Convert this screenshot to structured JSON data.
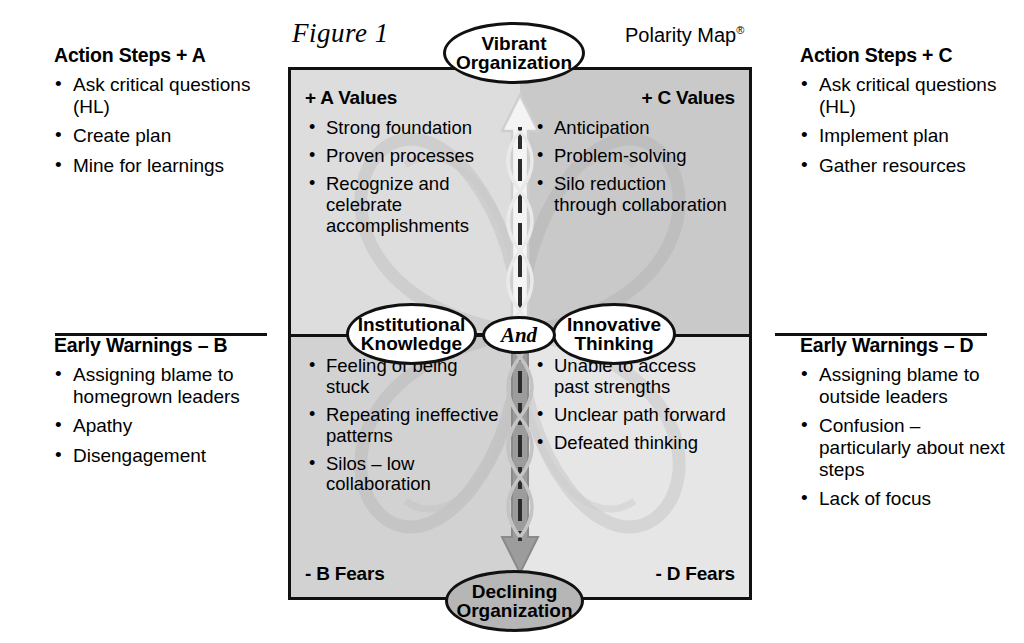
{
  "header": {
    "figure_label": "Figure 1",
    "polarity_map_label": "Polarity Map",
    "registered_mark": "®"
  },
  "ovals": {
    "top": "Vibrant\nOrganization",
    "top_line1": "Vibrant",
    "top_line2": "Organization",
    "bottom_line1": "Declining",
    "bottom_line2": "Organization",
    "left_line1": "Institutional",
    "left_line2": "Knowledge",
    "right_line1": "Innovative",
    "right_line2": "Thinking",
    "center": "And"
  },
  "quadrants": {
    "upper_left": {
      "heading": "+ A Values",
      "items": [
        "Strong foundation",
        "Proven processes",
        "Recognize and celebrate accomplishments"
      ]
    },
    "upper_right": {
      "heading": "+ C Values",
      "items": [
        "Anticipation",
        "Problem-solving",
        "Silo reduction through collaboration"
      ]
    },
    "lower_left": {
      "heading": "- B Fears",
      "items": [
        "Feeling of being stuck",
        "Repeating ineffective patterns",
        "Silos – low collaboration"
      ]
    },
    "lower_right": {
      "heading": "- D Fears",
      "items": [
        "Unable to access past strengths",
        "Unclear path forward",
        "Defeated thinking"
      ]
    }
  },
  "side_panels": {
    "action_steps_a": {
      "heading": "Action Steps + A",
      "items": [
        "Ask critical questions (HL)",
        "Create plan",
        "Mine for learnings"
      ]
    },
    "action_steps_c": {
      "heading": "Action Steps + C",
      "items": [
        "Ask critical questions (HL)",
        "Implement plan",
        "Gather resources"
      ]
    },
    "early_warnings_b": {
      "heading": "Early Warnings – B",
      "items": [
        "Assigning blame to homegrown leaders",
        "Apathy",
        "Disengagement"
      ]
    },
    "early_warnings_d": {
      "heading": "Early Warnings – D",
      "items": [
        "Assigning blame to outside leaders",
        "Confusion – particularly about next steps",
        "Lack of focus"
      ]
    }
  },
  "colors": {
    "border": "#111111",
    "quad_upper_left": "#dddddd",
    "quad_upper_right": "#c9c9c9",
    "quad_lower_left": "#d2d2d2",
    "quad_lower_right": "#e6e6e6",
    "declining_oval_fill": "#b6b6b6",
    "up_arrow_fill": "#f2f2f2",
    "down_arrow_fill": "#9a9a9a"
  }
}
